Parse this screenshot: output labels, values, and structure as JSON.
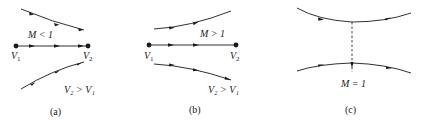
{
  "figure": {
    "panels": [
      {
        "id": "a",
        "caption": "(a)",
        "mach_label": "M < 1",
        "v1_label": "V",
        "v1_sub": "1",
        "v2_label": "V",
        "v2_sub": "2",
        "relation": "V₂ > V₁",
        "flow": "converging streamlines"
      },
      {
        "id": "b",
        "caption": "(b)",
        "mach_label": "M > 1",
        "v1_label": "V",
        "v1_sub": "1",
        "v2_label": "V",
        "v2_sub": "2",
        "relation": "V₂ > V₁",
        "flow": "diverging streamlines"
      },
      {
        "id": "c",
        "caption": "(c)",
        "mach_label": "M = 1",
        "flow": "throat (minimum area)"
      }
    ],
    "colors": {
      "line": "#1a1a1a",
      "text": "#222222",
      "background": "#ffffff"
    }
  }
}
